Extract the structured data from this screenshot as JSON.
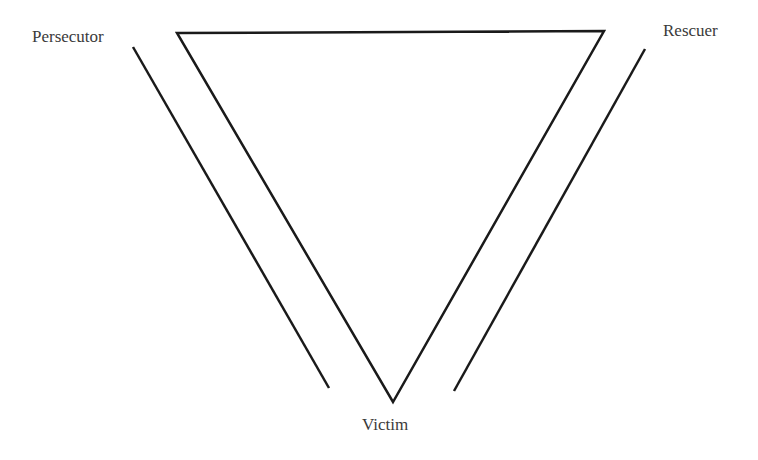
{
  "diagram": {
    "labels": {
      "persecutor": "Persecutor",
      "rescuer": "Rescuer",
      "victim": "Victim"
    },
    "colors": {
      "line": "#1a1a1a",
      "text": "#3a3a3a",
      "background": "#ffffff"
    }
  }
}
